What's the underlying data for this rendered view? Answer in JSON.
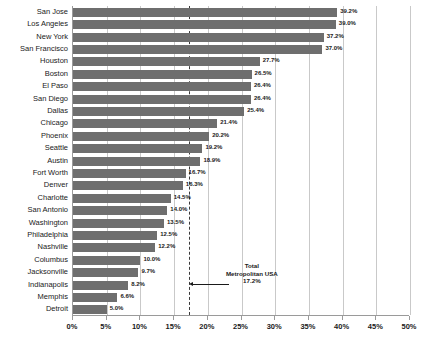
{
  "chart_data": {
    "type": "bar",
    "orientation": "horizontal",
    "title": "",
    "xlabel": "",
    "ylabel": "",
    "xlim": [
      0,
      50
    ],
    "grid": true,
    "legend": "none",
    "xtick_labels": [
      "0%",
      "5%",
      "10%",
      "15%",
      "20%",
      "25%",
      "30%",
      "35%",
      "40%",
      "45%",
      "50%"
    ],
    "xtick_values": [
      0,
      5,
      10,
      15,
      20,
      25,
      30,
      35,
      40,
      45,
      50
    ],
    "categories": [
      "San Jose",
      "Los Angeles",
      "New York",
      "San Francisco",
      "Houston",
      "Boston",
      "El Paso",
      "San Diego",
      "Dallas",
      "Chicago",
      "Phoenix",
      "Seattle",
      "Austin",
      "Fort Worth",
      "Denver",
      "Charlotte",
      "San Antonio",
      "Washington",
      "Philadelphia",
      "Nashville",
      "Columbus",
      "Jacksonville",
      "Indianapolis",
      "Memphis",
      "Detroit"
    ],
    "values": [
      39.2,
      39.0,
      37.2,
      37.0,
      27.7,
      26.5,
      26.4,
      26.4,
      25.4,
      21.4,
      20.2,
      19.2,
      18.9,
      16.7,
      16.3,
      14.5,
      14.0,
      13.5,
      12.5,
      12.2,
      10.0,
      9.7,
      8.2,
      6.6,
      5.0
    ],
    "value_labels": [
      "39.2%",
      "39.0%",
      "37.2%",
      "37.0%",
      "27.7%",
      "26.5%",
      "26.4%",
      "26.4%",
      "25.4%",
      "21.4%",
      "20.2%",
      "19.2%",
      "18.9%",
      "16.7%",
      "16.3%",
      "14.5%",
      "14.0%",
      "13.5%",
      "12.5%",
      "12.2%",
      "10.0%",
      "9.7%",
      "8.2%",
      "6.6%",
      "5.0%"
    ],
    "reference_line": {
      "value": 17.2,
      "style": "dashed",
      "label_line1": "Total",
      "label_line2": "Metropolitan USA",
      "label_line3": "17.2%"
    },
    "colors": {
      "bar": "#6e6e6e",
      "gridline": "#c9c9c9",
      "axis": "#9a9a9a",
      "text": "#1a1a1a",
      "background": "#ffffff"
    }
  }
}
